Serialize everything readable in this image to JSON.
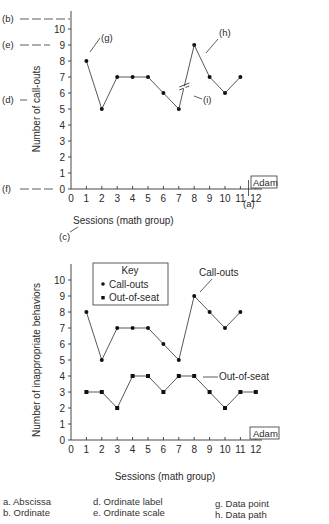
{
  "chart_data": [
    {
      "type": "line",
      "title": "",
      "xlabel": "Sessions (math group)",
      "ylabel": "Number of call-outs",
      "xlim": [
        0,
        12
      ],
      "ylim": [
        0,
        10
      ],
      "x_ticks": [
        "0",
        "1",
        "2",
        "3",
        "4",
        "5",
        "6",
        "7",
        "8",
        "9",
        "10",
        "11",
        "12"
      ],
      "y_ticks": [
        "0",
        "1",
        "2",
        "3",
        "4",
        "5",
        "6",
        "7",
        "8",
        "9",
        "10"
      ],
      "subject_label": "Adam",
      "series": [
        {
          "name": "Call-outs",
          "marker": "circle",
          "segments": [
            {
              "x": [
                1,
                2,
                3,
                4,
                5,
                6,
                7
              ],
              "values": [
                8,
                5,
                7,
                7,
                7,
                6,
                5
              ]
            },
            {
              "x": [
                8,
                9,
                10,
                11
              ],
              "values": [
                9,
                7,
                6,
                7
              ]
            }
          ],
          "path_break_between": [
            7,
            8
          ]
        }
      ],
      "annotations": [
        {
          "label": "(a)",
          "target": "Abscissa"
        },
        {
          "label": "(b)",
          "target": "Ordinate"
        },
        {
          "label": "(c)",
          "target": "Abscissa label"
        },
        {
          "label": "(d)",
          "target": "Ordinate label"
        },
        {
          "label": "(e)",
          "target": "Ordinate scale"
        },
        {
          "label": "(f)",
          "target": "Origin"
        },
        {
          "label": "(g)",
          "target": "Data point"
        },
        {
          "label": "(h)",
          "target": "Data path"
        },
        {
          "label": "(i)",
          "target": "Path break"
        }
      ],
      "grid": false
    },
    {
      "type": "line",
      "title": "",
      "xlabel": "Sessions (math group)",
      "ylabel": "Number of inappropriate behaviors",
      "xlim": [
        0,
        12
      ],
      "ylim": [
        0,
        10
      ],
      "x_ticks": [
        "0",
        "1",
        "2",
        "3",
        "4",
        "5",
        "6",
        "7",
        "8",
        "9",
        "10",
        "11",
        "12"
      ],
      "y_ticks": [
        "0",
        "1",
        "2",
        "3",
        "4",
        "5",
        "6",
        "7",
        "8",
        "9",
        "10"
      ],
      "subject_label": "Adam",
      "legend": {
        "title": "Key",
        "position": "upper-left",
        "entries": [
          {
            "label": "Call-outs",
            "marker": "circle"
          },
          {
            "label": "Out-of-seat",
            "marker": "square"
          }
        ]
      },
      "series": [
        {
          "name": "Call-outs",
          "marker": "circle",
          "x": [
            1,
            2,
            3,
            4,
            5,
            6,
            7,
            8,
            9,
            10,
            11
          ],
          "values": [
            8,
            5,
            7,
            7,
            7,
            6,
            5,
            9,
            8,
            7,
            8
          ]
        },
        {
          "name": "Out-of-seat",
          "marker": "square",
          "x": [
            1,
            2,
            3,
            4,
            5,
            6,
            7,
            8,
            9,
            10,
            11,
            12
          ],
          "values": [
            3,
            3,
            2,
            4,
            4,
            3,
            4,
            4,
            3,
            2,
            3,
            3
          ]
        }
      ],
      "series_labels": [
        "Call-outs",
        "Out-of-seat"
      ],
      "grid": false
    }
  ],
  "top_chart": {
    "ylabel": "Number of call-outs",
    "xlabel": "Sessions (math group)",
    "subject": "Adam",
    "callouts": {
      "a": "(a)",
      "b": "(b)",
      "c": "(c)",
      "d": "(d)",
      "e": "(e)",
      "f": "(f)",
      "g": "(g)",
      "h": "(h)",
      "i": "(i)"
    }
  },
  "bottom_chart": {
    "ylabel": "Number of inappropriate behaviors",
    "xlabel": "Sessions (math group)",
    "subject": "Adam",
    "key_title": "Key",
    "key_items": [
      "Call-outs",
      "Out-of-seat"
    ],
    "line_label_callouts": "Call-outs",
    "line_label_outofseat": "Out-of-seat"
  },
  "glossary": {
    "col1": [
      "a. Abscissa",
      "b. Ordinate"
    ],
    "col2": [
      "d. Ordinate label",
      "e. Ordinate scale"
    ],
    "col3": [
      "g. Data point",
      "h. Data path"
    ]
  }
}
